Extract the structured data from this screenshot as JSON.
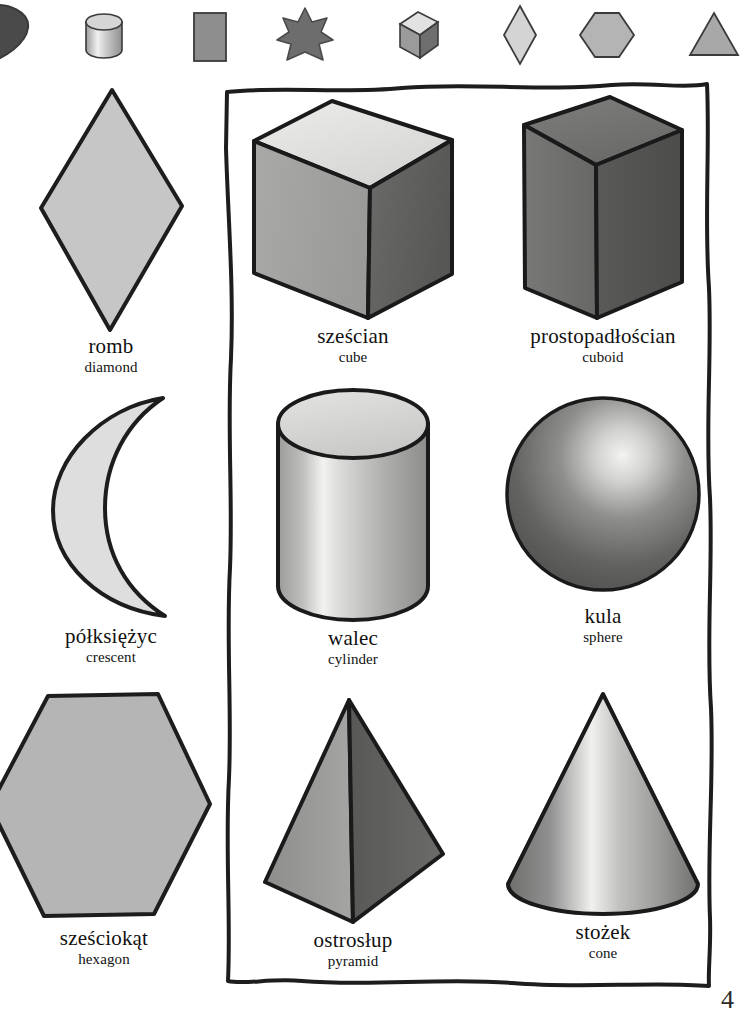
{
  "page": {
    "kind": "picture-dictionary-page",
    "language_primary": "Polish",
    "language_secondary": "English",
    "page_number": "4",
    "background_color": "#ffffff",
    "ink_color": "#111111"
  },
  "icon_strip": {
    "name": "shape-icon-strip",
    "items": [
      {
        "icon": "heart-icon",
        "label": "heart",
        "tone": "#4f4f4f"
      },
      {
        "icon": "cylinder-icon",
        "label": "cylinder",
        "tone": "#b9b9b9"
      },
      {
        "icon": "rectangle-icon",
        "label": "rectangle",
        "tone": "#8e8e8e"
      },
      {
        "icon": "star-icon",
        "label": "star",
        "tone": "#6d6d6d"
      },
      {
        "icon": "cube-icon",
        "label": "cube",
        "tone": "#9a9a9a"
      },
      {
        "icon": "diamond-icon",
        "label": "diamond",
        "tone": "#cfcfcf"
      },
      {
        "icon": "hexagon-icon",
        "label": "hexagon",
        "tone": "#b4b4b4"
      },
      {
        "icon": "triangle-icon",
        "label": "triangle",
        "tone": "#a8a8a8"
      }
    ]
  },
  "shapes": {
    "flat_column": [
      {
        "icon": "diamond-shape",
        "pl": "romb",
        "en": "diamond",
        "fill": "#c6c6c6"
      },
      {
        "icon": "crescent-shape",
        "pl": "półksiężyc",
        "en": "crescent",
        "fill": "#dcdcdc"
      },
      {
        "icon": "hexagon-shape",
        "pl": "sześciokąt",
        "en": "hexagon",
        "fill": "#b5b5b5"
      }
    ],
    "solids_box": {
      "name": "solids-border-box",
      "middle_column": [
        {
          "icon": "cube-shape",
          "pl": "sześcian",
          "en": "cube",
          "fill": "#a2a2a2"
        },
        {
          "icon": "cylinder-shape",
          "pl": "walec",
          "en": "cylinder",
          "fill": "#bdbdbd"
        },
        {
          "icon": "pyramid-shape",
          "pl": "ostrosłup",
          "en": "pyramid",
          "fill": "#8b8b8b"
        }
      ],
      "right_column": [
        {
          "icon": "cuboid-shape",
          "pl": "prostopadłościan",
          "en": "cuboid",
          "fill": "#6f6f6f"
        },
        {
          "icon": "sphere-shape",
          "pl": "kula",
          "en": "sphere",
          "fill": "#6a6a6a"
        },
        {
          "icon": "cone-shape",
          "pl": "stożek",
          "en": "cone",
          "fill": "#8f8f8f"
        }
      ]
    }
  }
}
